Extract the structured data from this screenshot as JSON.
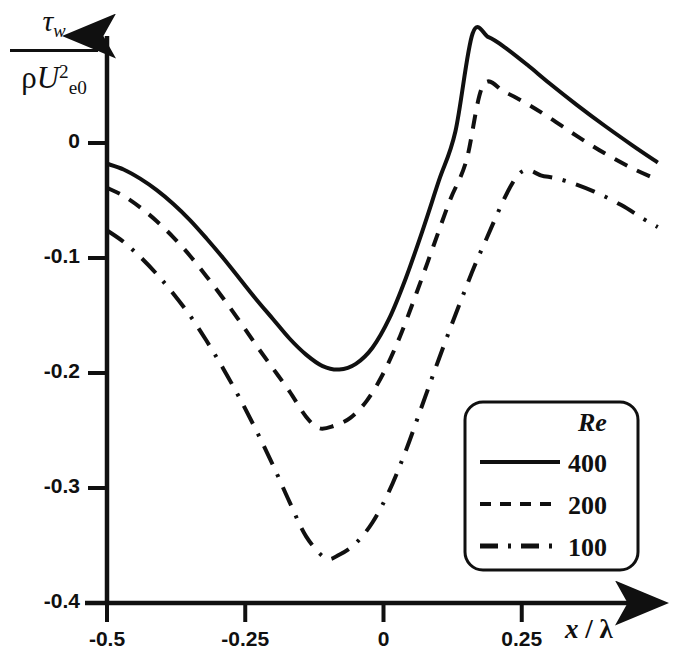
{
  "chart_data": {
    "type": "line",
    "title": "",
    "xlabel": "x / λ",
    "ylabel": "τ_w / (ρ U_e0^2)",
    "xlim": [
      -0.5,
      0.5
    ],
    "ylim": [
      -0.4,
      0.12
    ],
    "xticks": [
      -0.5,
      -0.25,
      0,
      0.25
    ],
    "xtick_labels": [
      "-0.5",
      "-0.25",
      "0",
      "0.25"
    ],
    "yticks": [
      0,
      -0.1,
      -0.2,
      -0.3,
      -0.4
    ],
    "ytick_labels": [
      "0",
      "-0.1",
      "-0.2",
      "-0.3",
      "-0.4"
    ],
    "grid": false,
    "legend_position": "lower right",
    "legend_title": "Re",
    "series": [
      {
        "name": "400",
        "style": "solid",
        "x": [
          -0.5,
          -0.47,
          -0.44,
          -0.41,
          -0.38,
          -0.35,
          -0.32,
          -0.29,
          -0.26,
          -0.23,
          -0.2,
          -0.17,
          -0.14,
          -0.11,
          -0.08,
          -0.05,
          -0.02,
          0.01,
          0.04,
          0.07,
          0.1,
          0.13,
          0.161,
          0.19,
          0.22,
          0.26,
          0.3,
          0.35,
          0.4,
          0.45,
          0.496
        ],
        "y": [
          -0.018,
          -0.023,
          -0.031,
          -0.041,
          -0.053,
          -0.067,
          -0.083,
          -0.1,
          -0.118,
          -0.136,
          -0.153,
          -0.17,
          -0.184,
          -0.194,
          -0.197,
          -0.192,
          -0.178,
          -0.153,
          -0.118,
          -0.077,
          -0.033,
          0.01,
          0.095,
          0.092,
          0.083,
          0.068,
          0.052,
          0.033,
          0.015,
          -0.002,
          -0.017
        ]
      },
      {
        "name": "200",
        "style": "dashed",
        "x": [
          -0.5,
          -0.47,
          -0.44,
          -0.41,
          -0.38,
          -0.35,
          -0.32,
          -0.29,
          -0.26,
          -0.23,
          -0.2,
          -0.17,
          -0.14,
          -0.116,
          -0.09,
          -0.06,
          -0.03,
          0.0,
          0.03,
          0.06,
          0.09,
          0.12,
          0.15,
          0.18,
          0.22,
          0.26,
          0.3,
          0.35,
          0.4,
          0.45,
          0.496
        ],
        "y": [
          -0.039,
          -0.046,
          -0.056,
          -0.068,
          -0.082,
          -0.098,
          -0.116,
          -0.135,
          -0.155,
          -0.176,
          -0.196,
          -0.216,
          -0.238,
          -0.248,
          -0.246,
          -0.239,
          -0.224,
          -0.2,
          -0.168,
          -0.13,
          -0.09,
          -0.05,
          -0.015,
          0.05,
          0.044,
          0.034,
          0.022,
          0.006,
          -0.009,
          -0.022,
          -0.032
        ]
      },
      {
        "name": "100",
        "style": "dashdot",
        "x": [
          -0.5,
          -0.47,
          -0.44,
          -0.41,
          -0.38,
          -0.35,
          -0.32,
          -0.29,
          -0.26,
          -0.23,
          -0.2,
          -0.17,
          -0.14,
          -0.105,
          -0.08,
          -0.05,
          -0.02,
          0.01,
          0.04,
          0.07,
          0.1,
          0.14,
          0.18,
          0.243,
          0.29,
          0.33,
          0.38,
          0.43,
          0.47,
          0.496
        ],
        "y": [
          -0.076,
          -0.086,
          -0.099,
          -0.114,
          -0.131,
          -0.15,
          -0.172,
          -0.196,
          -0.222,
          -0.25,
          -0.28,
          -0.312,
          -0.342,
          -0.361,
          -0.358,
          -0.348,
          -0.33,
          -0.303,
          -0.268,
          -0.228,
          -0.188,
          -0.137,
          -0.09,
          -0.028,
          -0.029,
          -0.033,
          -0.042,
          -0.054,
          -0.066,
          -0.073
        ]
      }
    ]
  },
  "axes": {
    "y_axis_numerator": "τ",
    "y_axis_numerator_sub": "w",
    "y_axis_den_rho": "ρ",
    "y_axis_den_U": "U",
    "y_axis_den_sub": "e0",
    "y_axis_den_sup": "2",
    "x_axis_var": "x",
    "x_axis_slash": "/",
    "x_axis_lambda": "λ"
  },
  "legend": {
    "title": "Re",
    "entries": [
      {
        "label": "400",
        "style": "solid"
      },
      {
        "label": "200",
        "style": "dashed"
      },
      {
        "label": "100",
        "style": "dashdot"
      }
    ]
  },
  "colors": {
    "ink": "#101010",
    "background": "#ffffff"
  }
}
